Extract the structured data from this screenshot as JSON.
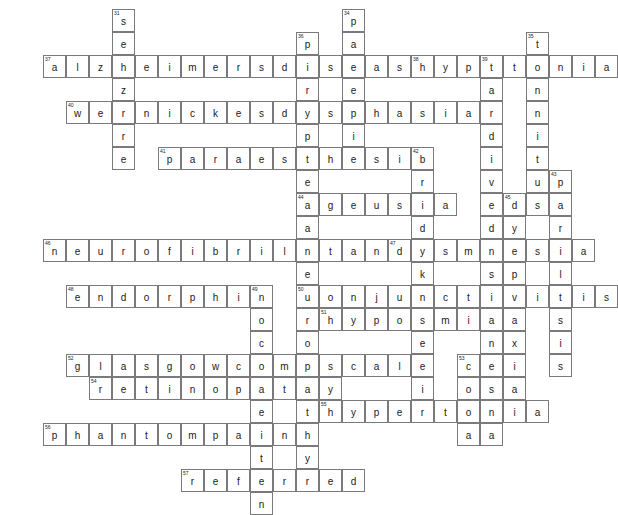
{
  "puzzle": {
    "title": "Neurology Crossword Grid",
    "grid": {
      "origin_x": 43,
      "origin_y": 9,
      "cell_size": 23,
      "cols": 24,
      "rows": 19
    },
    "entries": [
      {
        "number": "31",
        "answer": "seizure",
        "direction": "down",
        "row": 0,
        "col": 3
      },
      {
        "number": "34",
        "answer": "paresis",
        "direction": "down",
        "row": 0,
        "col": 13
      },
      {
        "number": "35",
        "answer": "tinnitus",
        "direction": "down",
        "row": 1,
        "col": 21
      },
      {
        "number": "36",
        "answer": "peripheral",
        "direction": "down",
        "row": 1,
        "col": 11
      },
      {
        "number": "37",
        "answer": "alzheimersdisease",
        "direction": "across",
        "row": 2,
        "col": 0
      },
      {
        "number": "38",
        "answer": "hypotonia",
        "direction": "across",
        "row": 2,
        "col": 16
      },
      {
        "number": "39",
        "answer": "tardivedyskinesia",
        "direction": "down",
        "row": 2,
        "col": 19
      },
      {
        "number": "40",
        "answer": "wernickesdysphasia",
        "direction": "across",
        "row": 4,
        "col": 1
      },
      {
        "number": "41",
        "answer": "paraesthesia",
        "direction": "across",
        "row": 6,
        "col": 5
      },
      {
        "number": "42",
        "answer": "bradykinesia",
        "direction": "down",
        "row": 6,
        "col": 16
      },
      {
        "number": "43",
        "answer": "paralysis",
        "direction": "down",
        "row": 7,
        "col": 22
      },
      {
        "number": "44",
        "answer": "ageusia",
        "direction": "across",
        "row": 8,
        "col": 11
      },
      {
        "number": "45",
        "answer": "dyspraxia",
        "direction": "down",
        "row": 8,
        "col": 20
      },
      {
        "number": "46",
        "answer": "neurofibrilltangle",
        "direction": "across",
        "row": 10,
        "col": 0
      },
      {
        "number": "47",
        "answer": "dysmnesia",
        "direction": "across",
        "row": 10,
        "col": 15
      },
      {
        "number": "48",
        "answer": "endorphin",
        "direction": "across",
        "row": 12,
        "col": 1
      },
      {
        "number": "49",
        "answer": "nociceptin",
        "direction": "down",
        "row": 12,
        "col": 9
      },
      {
        "number": "50",
        "answer": "conjunctivitis",
        "direction": "across",
        "row": 12,
        "col": 11
      },
      {
        "number": "51",
        "answer": "hyposmia",
        "direction": "across",
        "row": 13,
        "col": 12
      },
      {
        "number": "52",
        "answer": "glasgowcomascale",
        "direction": "across",
        "row": 15,
        "col": 1
      },
      {
        "number": "53",
        "answer": "coma",
        "direction": "down",
        "row": 15,
        "col": 18
      },
      {
        "number": "54",
        "answer": "retinopathy",
        "direction": "across",
        "row": 16,
        "col": 2
      },
      {
        "number": "55",
        "answer": "hypertonia",
        "direction": "across",
        "row": 17,
        "col": 12
      },
      {
        "number": "56",
        "answer": "phantompain",
        "direction": "across",
        "row": 18,
        "col": 0
      },
      {
        "number": "57",
        "answer": "referred",
        "direction": "across",
        "row": 20,
        "col": 6
      },
      {
        "number": "",
        "answer": "neuropathy",
        "direction": "down",
        "row": 10,
        "col": 11
      }
    ],
    "colors": {
      "cell_border": "#7a7a7a",
      "cell_fill": "#ffffff",
      "letter": "#1a1a1a",
      "number": "#222222",
      "page_background": "#ffffff"
    }
  }
}
